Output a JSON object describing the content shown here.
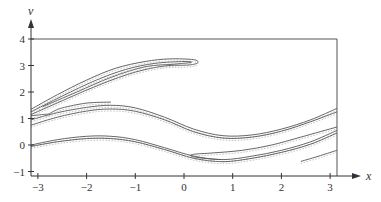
{
  "chart_data": {
    "type": "line",
    "title": "",
    "xlabel": "x",
    "ylabel": "v",
    "xlim": [
      -3.1416,
      3.1416
    ],
    "ylim": [
      -1.17,
      4.0
    ],
    "grid": false,
    "legend": null,
    "x_ticks": [
      -3,
      -2,
      -1,
      0,
      1,
      2,
      3
    ],
    "x_tick_labels": [
      "−3",
      "−2",
      "−1",
      "0",
      "1",
      "2",
      "3"
    ],
    "y_ticks": [
      -1,
      0,
      1,
      2,
      3,
      4
    ],
    "y_tick_labels": [
      "−1",
      "0",
      "1",
      "2",
      "3",
      "4"
    ],
    "frame": {
      "left": -3.1416,
      "right": 3.1416,
      "top": 4.0,
      "bottom": -1.17
    },
    "line_color": "#555555",
    "series": [
      {
        "name": "upper-tongue-outer",
        "points": [
          [
            -3.14,
            1.35
          ],
          [
            -2.6,
            1.9
          ],
          [
            -2.0,
            2.45
          ],
          [
            -1.4,
            2.9
          ],
          [
            -0.8,
            3.15
          ],
          [
            -0.3,
            3.25
          ],
          [
            0.2,
            3.22
          ],
          [
            0.28,
            3.1
          ],
          [
            0.1,
            3.02
          ],
          [
            -0.4,
            2.98
          ],
          [
            -1.0,
            2.75
          ],
          [
            -1.7,
            2.3
          ],
          [
            -2.4,
            1.75
          ],
          [
            -3.14,
            1.15
          ]
        ]
      },
      {
        "name": "upper-tongue-inner",
        "points": [
          [
            -3.14,
            1.25
          ],
          [
            -2.5,
            1.85
          ],
          [
            -1.8,
            2.45
          ],
          [
            -1.2,
            2.85
          ],
          [
            -0.6,
            3.08
          ],
          [
            0.0,
            3.15
          ],
          [
            0.15,
            3.12
          ],
          [
            -0.2,
            3.05
          ],
          [
            -0.8,
            2.95
          ],
          [
            -1.5,
            2.55
          ],
          [
            -2.2,
            2.0
          ],
          [
            -2.9,
            1.45
          ]
        ]
      },
      {
        "name": "middle-band-a",
        "points": [
          [
            -3.14,
            0.95
          ],
          [
            -2.6,
            1.22
          ],
          [
            -2.0,
            1.42
          ],
          [
            -1.5,
            1.5
          ],
          [
            -1.0,
            1.4
          ],
          [
            -0.4,
            1.05
          ],
          [
            0.2,
            0.6
          ],
          [
            0.8,
            0.35
          ],
          [
            1.4,
            0.38
          ],
          [
            2.0,
            0.6
          ],
          [
            2.6,
            0.95
          ],
          [
            3.14,
            1.38
          ]
        ]
      },
      {
        "name": "middle-band-b",
        "points": [
          [
            -3.14,
            0.75
          ],
          [
            -2.6,
            1.05
          ],
          [
            -2.0,
            1.28
          ],
          [
            -1.5,
            1.36
          ],
          [
            -1.0,
            1.27
          ],
          [
            -0.4,
            0.95
          ],
          [
            0.2,
            0.5
          ],
          [
            0.8,
            0.26
          ],
          [
            1.4,
            0.3
          ],
          [
            2.0,
            0.52
          ],
          [
            2.6,
            0.88
          ],
          [
            3.14,
            1.25
          ]
        ]
      },
      {
        "name": "middle-tongue-left",
        "points": [
          [
            -3.14,
            1.1
          ],
          [
            -2.9,
            1.15
          ],
          [
            -2.78,
            1.17
          ],
          [
            -2.7,
            1.25
          ],
          [
            -2.5,
            1.4
          ],
          [
            -2.0,
            1.58
          ],
          [
            -1.5,
            1.62
          ]
        ]
      },
      {
        "name": "lower-band-a",
        "points": [
          [
            -3.14,
            0.0
          ],
          [
            -2.6,
            0.2
          ],
          [
            -2.0,
            0.33
          ],
          [
            -1.5,
            0.33
          ],
          [
            -1.0,
            0.2
          ],
          [
            -0.4,
            -0.1
          ],
          [
            0.2,
            -0.42
          ],
          [
            0.8,
            -0.55
          ],
          [
            1.4,
            -0.42
          ],
          [
            2.0,
            -0.2
          ],
          [
            2.6,
            0.12
          ],
          [
            3.14,
            0.55
          ]
        ]
      },
      {
        "name": "lower-band-b",
        "points": [
          [
            -3.14,
            -0.05
          ],
          [
            -2.6,
            0.12
          ],
          [
            -2.0,
            0.24
          ],
          [
            -1.5,
            0.24
          ],
          [
            -1.0,
            0.12
          ],
          [
            -0.4,
            -0.17
          ],
          [
            0.2,
            -0.5
          ],
          [
            0.8,
            -0.63
          ],
          [
            1.4,
            -0.5
          ],
          [
            2.0,
            -0.28
          ],
          [
            2.6,
            0.03
          ],
          [
            3.14,
            0.45
          ]
        ]
      },
      {
        "name": "lower-tongue",
        "points": [
          [
            0.75,
            -0.55
          ],
          [
            0.4,
            -0.5
          ],
          [
            0.15,
            -0.42
          ],
          [
            0.2,
            -0.35
          ],
          [
            0.6,
            -0.3
          ],
          [
            1.2,
            -0.2
          ],
          [
            1.8,
            0.0
          ],
          [
            2.4,
            0.3
          ],
          [
            3.14,
            0.68
          ]
        ]
      },
      {
        "name": "lower-right-segment",
        "points": [
          [
            2.4,
            -0.62
          ],
          [
            2.8,
            -0.4
          ],
          [
            3.14,
            -0.2
          ]
        ]
      }
    ]
  }
}
